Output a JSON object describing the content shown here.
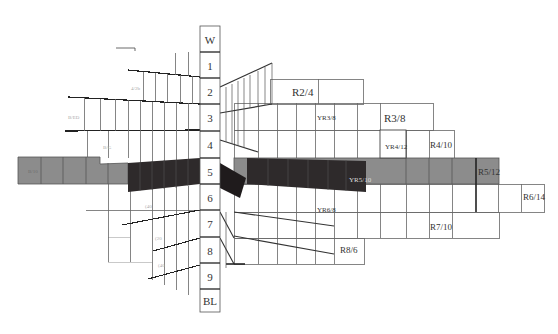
{
  "diagram": {
    "type": "munsell-hue-page",
    "value_scale": {
      "labels": [
        "W",
        "1",
        "2",
        "3",
        "4",
        "5",
        "6",
        "7",
        "8",
        "9",
        "BL"
      ]
    },
    "right_labels": [
      {
        "id": "r2-4",
        "text": "R2/4"
      },
      {
        "id": "yr3-8",
        "text": "YR3/8"
      },
      {
        "id": "r3-8",
        "text": "R3/8"
      },
      {
        "id": "yr4-12",
        "text": "YR4/12"
      },
      {
        "id": "r4-10",
        "text": "R4/10"
      },
      {
        "id": "yr5-10",
        "text": "YR5/10"
      },
      {
        "id": "r5-12",
        "text": "R5/12"
      },
      {
        "id": "r6-14",
        "text": "R6/14"
      },
      {
        "id": "yr6-8",
        "text": "YR6/8"
      },
      {
        "id": "r7-10",
        "text": "R7/10"
      },
      {
        "id": "r8-6",
        "text": "R8/6"
      }
    ],
    "left_labels": [
      {
        "id": "l-2",
        "text": "4/2b"
      },
      {
        "id": "l-3",
        "text": "B/ED"
      },
      {
        "id": "l-4",
        "text": "B/G"
      },
      {
        "id": "l-5",
        "text": "B/10"
      },
      {
        "id": "l-6",
        "text": "(40"
      },
      {
        "id": "l-7",
        "text": "(20"
      },
      {
        "id": "l-8",
        "text": "(40"
      }
    ],
    "colors": {
      "dark_band": "#2e2a2b",
      "mid_band": "#8a8a8a",
      "grid_line": "#555555",
      "faint_line": "#bbbbbb"
    }
  }
}
